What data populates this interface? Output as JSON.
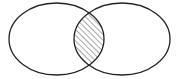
{
  "diagram": {
    "type": "venn",
    "sets": [
      {
        "id": "A",
        "label": "",
        "cx": 56.5,
        "cy": 39,
        "rx": 47.5,
        "ry": 36
      },
      {
        "id": "B",
        "label": "",
        "cx": 122,
        "cy": 39,
        "rx": 48,
        "ry": 36
      }
    ],
    "shaded_region": "A ∩ B",
    "shading_style": "diagonal-hatch",
    "colors": {
      "stroke": "#222222",
      "hatch": "#555555",
      "background": "#ffffff"
    }
  }
}
